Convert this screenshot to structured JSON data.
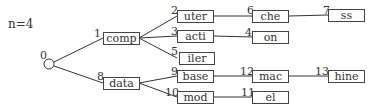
{
  "title": "n=4",
  "root": {
    "id": "0"
  },
  "nodes": [
    {
      "id": "1",
      "label": "comp"
    },
    {
      "id": "2",
      "label": "uter"
    },
    {
      "id": "3",
      "label": "acti"
    },
    {
      "id": "4",
      "label": "on"
    },
    {
      "id": "5",
      "label": "iler"
    },
    {
      "id": "6",
      "label": "che"
    },
    {
      "id": "7",
      "label": "ss"
    },
    {
      "id": "8",
      "label": "data"
    },
    {
      "id": "9",
      "label": "base"
    },
    {
      "id": "10",
      "label": "mod"
    },
    {
      "id": "11",
      "label": "el"
    },
    {
      "id": "12",
      "label": "mac"
    },
    {
      "id": "13",
      "label": "hine"
    }
  ]
}
